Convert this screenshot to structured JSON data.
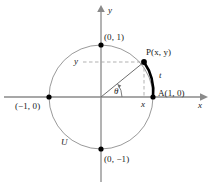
{
  "figure": {
    "colors": {
      "background": "#ffffff",
      "axis": "#8a8a8a",
      "circle": "#9a9a9a",
      "dashed": "#a8a8a8",
      "radius": "#6e6e6e",
      "arc_highlight": "#000000",
      "point": "#000000",
      "text": "#1a1a1a"
    },
    "geometry": {
      "center_x": 101,
      "center_y": 97,
      "radius_px": 52,
      "point_p_x": 144,
      "point_p_y": 62,
      "theta_degrees": 39
    },
    "axes": {
      "x_label": "x",
      "y_label": "y"
    },
    "points": [
      {
        "name": "top",
        "label": "(0, 1)",
        "x": 101,
        "y": 45
      },
      {
        "name": "left",
        "label": "(-1, 0)",
        "x": 49,
        "y": 97
      },
      {
        "name": "bottom",
        "label": "(0, -1)",
        "x": 101,
        "y": 149
      },
      {
        "name": "right",
        "label": "A(1, 0)",
        "x": 153,
        "y": 97
      },
      {
        "name": "p",
        "label": "P(x, y)",
        "x": 144,
        "y": 62
      }
    ],
    "labels": {
      "point_top": "(0, 1)",
      "point_left": "(−1, 0)",
      "point_bottom": "(0, −1)",
      "point_right": "A(1, 0)",
      "point_p": "P(x, y)",
      "circle_name": "U",
      "angle": "θ",
      "arc_length": "t",
      "leg_x": "x",
      "leg_y": "y",
      "axis_x": "x",
      "axis_y": "y"
    }
  }
}
